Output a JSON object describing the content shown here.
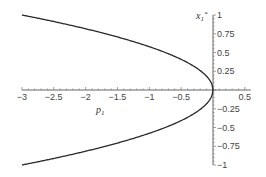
{
  "chart_data": {
    "type": "line",
    "title": "",
    "xlabel": "p",
    "xlabel_sub": "1",
    "ylabel": "x",
    "ylabel_sub": "1",
    "ylabel_sup": "*",
    "xlim": [
      -3,
      0.5
    ],
    "ylim": [
      -1,
      1
    ],
    "grid": false,
    "x_ticks": [
      {
        "value": -3,
        "label": "−3"
      },
      {
        "value": -2.5,
        "label": "−2.5"
      },
      {
        "value": -2,
        "label": "−2"
      },
      {
        "value": -1.5,
        "label": "−1.5"
      },
      {
        "value": -1,
        "label": "−1"
      },
      {
        "value": -0.5,
        "label": "−0.5"
      },
      {
        "value": 0.5,
        "label": "0.5"
      }
    ],
    "y_ticks": [
      {
        "value": 1,
        "label": "1"
      },
      {
        "value": 0.75,
        "label": "0.75"
      },
      {
        "value": 0.5,
        "label": "0.5"
      },
      {
        "value": 0.25,
        "label": "0.25"
      },
      {
        "value": -0.25,
        "label": "−0.25"
      },
      {
        "value": -0.5,
        "label": "−0.5"
      },
      {
        "value": -0.75,
        "label": "−0.75"
      },
      {
        "value": -1,
        "label": "−1"
      }
    ],
    "series": [
      {
        "name": "upper branch",
        "relation": "x1* = +sqrt(-p1/3)",
        "x": [
          -3,
          -2.5,
          -2,
          -1.5,
          -1,
          -0.5,
          -0.25,
          -0.1,
          0
        ],
        "y": [
          1.0,
          0.913,
          0.816,
          0.707,
          0.577,
          0.408,
          0.289,
          0.183,
          0
        ]
      },
      {
        "name": "lower branch",
        "relation": "x1* = -sqrt(-p1/3)",
        "x": [
          -3,
          -2.5,
          -2,
          -1.5,
          -1,
          -0.5,
          -0.25,
          -0.1,
          0
        ],
        "y": [
          -1.0,
          -0.913,
          -0.816,
          -0.707,
          -0.577,
          -0.408,
          -0.289,
          -0.183,
          0
        ]
      }
    ],
    "colors": {
      "curve": "#2a2a2a",
      "axis": "#666666",
      "text": "#444444"
    }
  }
}
